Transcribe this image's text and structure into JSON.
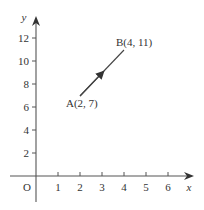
{
  "diagram": {
    "type": "coordinate-plane-vector",
    "axes": {
      "x_label": "x",
      "y_label": "y",
      "origin_label": "O",
      "x_ticks": [
        "1",
        "2",
        "3",
        "4",
        "5",
        "6"
      ],
      "y_ticks": [
        "2",
        "4",
        "6",
        "8",
        "10",
        "12"
      ]
    },
    "points": {
      "A": {
        "label": "A(2, 7)",
        "x": 2,
        "y": 7
      },
      "B": {
        "label": "B(4, 11)",
        "x": 4,
        "y": 11
      }
    },
    "vector": {
      "from": "A",
      "to": "B",
      "arrow": "midpoint"
    },
    "colors": {
      "ink": "#333333",
      "axis": "#555555"
    }
  }
}
